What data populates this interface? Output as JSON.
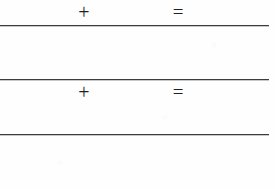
{
  "page": {
    "background_color": "#fefefe",
    "ink_color": "#1f1f1f",
    "rule_color": "#3c3c3c",
    "width": 275,
    "height": 189
  },
  "rules": [
    {
      "name": "rule-after-row-1",
      "y": 25
    },
    {
      "name": "rule-after-row-2",
      "y": 79
    },
    {
      "name": "rule-after-row-3",
      "y": 134
    }
  ],
  "rows": [
    {
      "index": 1,
      "operator_symbol": "+",
      "operator_name": "plus-sign",
      "equals_symbol": "=",
      "equals_name": "equals-sign",
      "has_rule_below": true
    },
    {
      "index": 2,
      "operator_symbol": "+",
      "operator_name": "plus-sign",
      "equals_symbol": "=",
      "equals_name": "equals-sign",
      "has_rule_below": true
    },
    {
      "index": 3,
      "operator_symbol": "−",
      "operator_name": "minus-sign",
      "equals_symbol": "=",
      "equals_name": "equals-sign",
      "has_rule_below": true
    },
    {
      "index": 4,
      "operator_symbol": "−",
      "operator_name": "minus-sign",
      "equals_symbol": "=",
      "equals_name": "equals-sign",
      "has_rule_below": false
    }
  ]
}
